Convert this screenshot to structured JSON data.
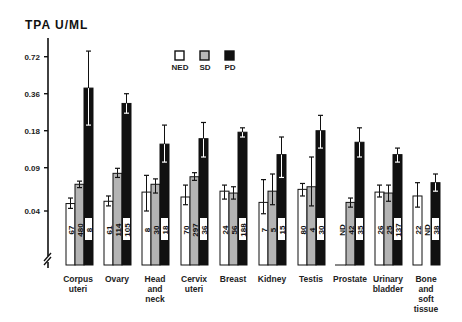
{
  "chart_data": {
    "type": "bar",
    "title": "",
    "ylabel": "TPA  U/ML",
    "xlabel": "",
    "yscale": "log",
    "yticks": [
      0.04,
      0.09,
      0.18,
      0.36,
      0.72
    ],
    "ytick_labels": [
      "0.04",
      "0.09",
      "0.18",
      "0.36",
      "0.72"
    ],
    "axis_break": true,
    "grid": false,
    "legend": {
      "position": "top-center",
      "entries": [
        {
          "name": "NED",
          "color": "#ffffff"
        },
        {
          "name": "SD",
          "color": "#b8b8b8"
        },
        {
          "name": "PD",
          "color": "#111111"
        }
      ]
    },
    "categories": [
      [
        "Corpus",
        "uteri"
      ],
      [
        "Ovary"
      ],
      [
        "Head",
        "and",
        "neck"
      ],
      [
        "Cervix",
        "uteri"
      ],
      [
        "Breast"
      ],
      [
        "Kidney"
      ],
      [
        "Testis"
      ],
      [
        "Prostate"
      ],
      [
        "Urinary",
        "bladder"
      ],
      [
        "Bone",
        "and",
        "soft",
        "tissue"
      ]
    ],
    "series": [
      {
        "name": "NED",
        "values": [
          0.046,
          0.048,
          0.057,
          0.052,
          0.058,
          0.047,
          0.06,
          null,
          0.057,
          0.053
        ],
        "err_low": [
          0.042,
          0.044,
          0.04,
          0.045,
          0.05,
          0.038,
          0.053,
          null,
          0.052,
          0.043
        ],
        "err_high": [
          0.051,
          0.053,
          0.078,
          0.065,
          0.065,
          0.072,
          0.067,
          null,
          0.065,
          0.068
        ],
        "n": [
          "67",
          "61",
          "8",
          "70",
          "24",
          "7",
          "80",
          "ND",
          "26",
          "22"
        ]
      },
      {
        "name": "SD",
        "values": [
          0.066,
          0.081,
          0.066,
          0.076,
          0.056,
          0.058,
          0.063,
          0.047,
          0.056,
          null
        ],
        "err_low": [
          0.062,
          0.075,
          0.056,
          0.071,
          0.05,
          0.045,
          0.044,
          0.043,
          0.048,
          null
        ],
        "err_high": [
          0.07,
          0.089,
          0.073,
          0.082,
          0.063,
          0.08,
          0.11,
          0.051,
          0.065,
          null
        ],
        "n": [
          "480",
          "114",
          "30",
          "297",
          "56",
          "5",
          "4",
          "42",
          "25",
          "ND"
        ]
      },
      {
        "name": "PD",
        "values": [
          0.4,
          0.3,
          0.14,
          0.155,
          0.175,
          0.115,
          0.18,
          0.145,
          0.115,
          0.068
        ],
        "err_low": [
          0.2,
          0.25,
          0.1,
          0.11,
          0.16,
          0.075,
          0.13,
          0.11,
          0.1,
          0.058
        ],
        "err_high": [
          0.8,
          0.36,
          0.2,
          0.21,
          0.19,
          0.16,
          0.24,
          0.19,
          0.13,
          0.08
        ],
        "n": [
          "8",
          "105",
          "18",
          "36",
          "188",
          "15",
          "30",
          "35",
          "137",
          "38"
        ]
      }
    ]
  }
}
